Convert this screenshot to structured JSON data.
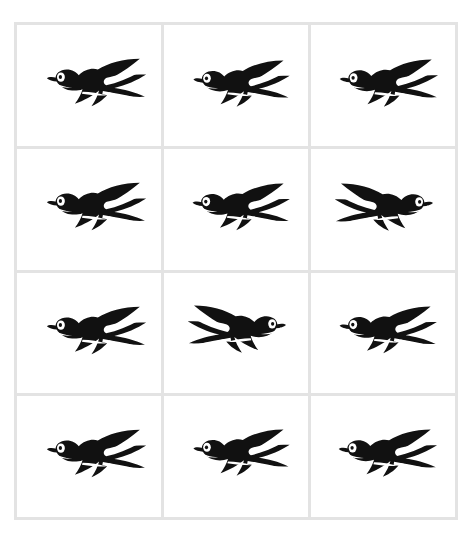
{
  "artwork": {
    "title": "Flying swallows pattern sheet",
    "description": "A twelve-panel sheet of black swallow silhouettes arranged in a grid of three columns by four rows",
    "subject": "swallow",
    "motif_count": 12,
    "columns": 3,
    "rows": 4,
    "palette": {
      "page_background": "#ffffff",
      "cell_background": "#ffffff",
      "grid_line": "#e3e3e3",
      "bird_body": "#111111",
      "bird_ink": "#0a0a0a",
      "eye_white": "#ffffff",
      "eye_pupil": "#111111",
      "throat_stripe": "#ffffff",
      "tail_stripe": "#ffffff"
    },
    "canvas": {
      "width": 472,
      "height": 538,
      "grid_left": 14,
      "grid_top": 22,
      "grid_width": 444,
      "grid_height": 498
    }
  },
  "cells": [
    {
      "id": "cell-r1-c1",
      "row": 1,
      "column": 1,
      "label": "Swallow facing left, wings swept back",
      "facing": "left",
      "mirrored": false,
      "scale": 1.0,
      "offset_x": 4,
      "offset_y": 4
    },
    {
      "id": "cell-r1-c2",
      "row": 1,
      "column": 2,
      "label": "Swallow facing left, wings swept back",
      "facing": "left",
      "mirrored": false,
      "scale": 0.97,
      "offset_x": 4,
      "offset_y": 6
    },
    {
      "id": "cell-r1-c3",
      "row": 1,
      "column": 3,
      "label": "Swallow facing left, wings swept back",
      "facing": "left",
      "mirrored": false,
      "scale": 0.99,
      "offset_x": 3,
      "offset_y": 5
    },
    {
      "id": "cell-r2-c1",
      "row": 2,
      "column": 1,
      "label": "Swallow facing left, wings swept back",
      "facing": "left",
      "mirrored": false,
      "scale": 1.0,
      "offset_x": 4,
      "offset_y": 4
    },
    {
      "id": "cell-r2-c2",
      "row": 2,
      "column": 2,
      "label": "Swallow facing left, wings swept back",
      "facing": "left",
      "mirrored": false,
      "scale": 0.98,
      "offset_x": 3,
      "offset_y": 5
    },
    {
      "id": "cell-r2-c3",
      "row": 2,
      "column": 3,
      "label": "Swallow facing right, mirrored",
      "facing": "right",
      "mirrored": true,
      "scale": 0.99,
      "offset_x": 3,
      "offset_y": 5
    },
    {
      "id": "cell-r3-c1",
      "row": 3,
      "column": 1,
      "label": "Swallow facing left, wings swept back",
      "facing": "left",
      "mirrored": false,
      "scale": 1.0,
      "offset_x": 4,
      "offset_y": 4
    },
    {
      "id": "cell-r3-c2",
      "row": 3,
      "column": 2,
      "label": "Swallow facing right, mirrored",
      "facing": "right",
      "mirrored": true,
      "scale": 0.99,
      "offset_x": 3,
      "offset_y": 3
    },
    {
      "id": "cell-r3-c3",
      "row": 3,
      "column": 3,
      "label": "Swallow facing left, wings swept back",
      "facing": "left",
      "mirrored": false,
      "scale": 0.98,
      "offset_x": 3,
      "offset_y": 4
    },
    {
      "id": "cell-r4-c1",
      "row": 4,
      "column": 1,
      "label": "Swallow facing left, wings swept back",
      "facing": "left",
      "mirrored": false,
      "scale": 1.0,
      "offset_x": 4,
      "offset_y": 4
    },
    {
      "id": "cell-r4-c2",
      "row": 4,
      "column": 2,
      "label": "Swallow facing left, wings swept back",
      "facing": "left",
      "mirrored": false,
      "scale": 0.97,
      "offset_x": 4,
      "offset_y": 4
    },
    {
      "id": "cell-r4-c3",
      "row": 4,
      "column": 3,
      "label": "Swallow facing left, wings swept back",
      "facing": "left",
      "mirrored": false,
      "scale": 0.99,
      "offset_x": 2,
      "offset_y": 4
    }
  ]
}
